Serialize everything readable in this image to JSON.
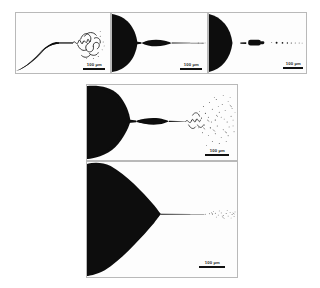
{
  "figure": {
    "kind": "micrograph-panel-array",
    "background_color": "#ffffff",
    "panel_border_color": "#b9b9b9",
    "ink_color": "#0d0d0d",
    "panel_count": 5
  },
  "panels": [
    {
      "id": "panel-1",
      "name": "top-left-panel",
      "position": "top-row-left",
      "description": "Dark conical nozzle at left tapering to a long thin jet that develops a coiling whipping instability toward the right.",
      "cone_shape": "concave-flared-cone",
      "jet_mode": "whipping-coiling-jet",
      "scalebar": {
        "value": "100",
        "unit": "µm",
        "label": "100 µm"
      }
    },
    {
      "id": "panel-2",
      "name": "top-middle-panel",
      "position": "top-row-middle",
      "description": "Rounded dark meniscus at left with a short spindle-shaped ligament and a fine straight jet extending to the right edge.",
      "cone_shape": "rounded-bulbous-meniscus",
      "jet_mode": "spindle-ligament-straight-jet",
      "scalebar": {
        "value": "100",
        "unit": "µm",
        "label": "100 µm"
      }
    },
    {
      "id": "panel-3",
      "name": "top-right-panel",
      "position": "top-row-right",
      "description": "Rounded dark meniscus at left edge with a detached elongated droplet and a trail of small satellite droplets to the right.",
      "cone_shape": "rounded-bulbous-meniscus",
      "jet_mode": "detached-droplet-train",
      "scalebar": {
        "value": "100",
        "unit": "µm",
        "label": "100 µm"
      }
    },
    {
      "id": "panel-4",
      "name": "middle-panel",
      "position": "second-row",
      "description": "Large rounded dark meniscus at left, spindle ligament, then a jet that breaks up into a broad spray cloud of fine droplets.",
      "cone_shape": "large-rounded-meniscus",
      "jet_mode": "jet-breakup-into-spray-cloud",
      "scalebar": {
        "value": "100",
        "unit": "µm",
        "label": "100 µm"
      }
    },
    {
      "id": "panel-5",
      "name": "bottom-panel",
      "position": "third-row",
      "description": "Large sharp triangular Taylor cone occupying the left half, emitting a very thin straight jet that breaks into a narrow droplet stream at the right.",
      "cone_shape": "sharp-taylor-cone",
      "jet_mode": "cone-jet-thin-filament-breakup",
      "scalebar": {
        "value": "100",
        "unit": "µm",
        "label": "100 µm"
      }
    }
  ]
}
